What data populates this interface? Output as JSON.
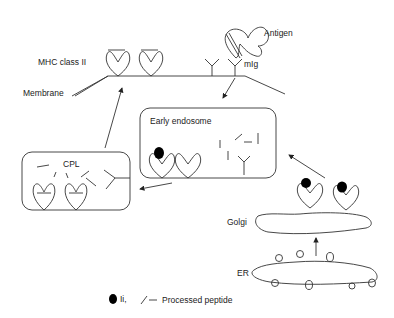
{
  "labels": {
    "mhc": "MHC class II",
    "membrane": "Membrane",
    "antigen": "Antigen",
    "mig": "mIg",
    "early_endosome": "Early endosome",
    "cpl": "CPL",
    "golgi": "Golgi",
    "er": "ER"
  },
  "legend": {
    "ii": "Ii,",
    "peptide": "Processed peptide"
  }
}
